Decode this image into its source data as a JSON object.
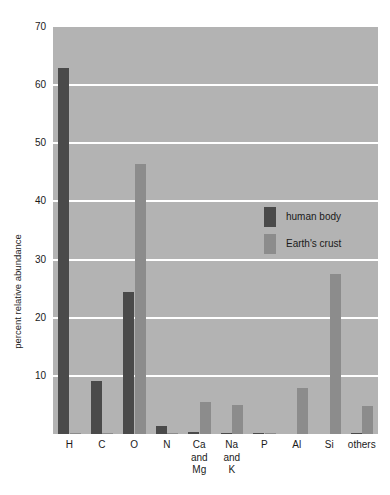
{
  "chart_data": {
    "type": "bar",
    "title": "",
    "subtitle": "",
    "xlabel": "",
    "ylabel": "percent relative abundance",
    "ylim": [
      0,
      70
    ],
    "yticks": [
      10,
      20,
      30,
      40,
      50,
      60,
      70
    ],
    "ytick_labels": [
      "10",
      "20",
      "30",
      "40",
      "50",
      "60",
      "70"
    ],
    "grid": "horizontal",
    "legend_position": "inside-upper-right",
    "categories": [
      "H",
      "C",
      "O",
      "N",
      "Ca\nand\nMg",
      "Na\nand\nK",
      "P",
      "Al",
      "Si",
      "others"
    ],
    "category_labels": [
      {
        "lines": [
          "H"
        ]
      },
      {
        "lines": [
          "C"
        ]
      },
      {
        "lines": [
          "O"
        ]
      },
      {
        "lines": [
          "N"
        ]
      },
      {
        "lines": [
          "Ca",
          "and",
          "Mg"
        ]
      },
      {
        "lines": [
          "Na",
          "and",
          "K"
        ]
      },
      {
        "lines": [
          "P"
        ]
      },
      {
        "lines": [
          "Al"
        ]
      },
      {
        "lines": [
          "Si"
        ]
      },
      {
        "lines": [
          "others"
        ]
      }
    ],
    "series": [
      {
        "name": "human body",
        "color": "#4a4a4a",
        "values": [
          63.0,
          9.1,
          24.4,
          1.4,
          0.3,
          0.2,
          0.2,
          0.0,
          0.0,
          0.2
        ]
      },
      {
        "name": "Earth's crust",
        "color": "#8c8c8c",
        "values": [
          0.14,
          0.03,
          46.5,
          0.03,
          5.5,
          5.0,
          0.2,
          7.9,
          27.5,
          4.8
        ]
      }
    ]
  },
  "legend": {
    "items": [
      {
        "label": "human body",
        "color": "#4a4a4a"
      },
      {
        "label": "Earth's crust",
        "color": "#8c8c8c"
      }
    ]
  },
  "colors": {
    "plot_background": "#b3b3b3",
    "gridline": "#ffffff",
    "page_background": "#ffffff",
    "text": "#1a1a1a",
    "human_body_bar": "#4a4a4a",
    "earths_crust_bar": "#8c8c8c"
  }
}
